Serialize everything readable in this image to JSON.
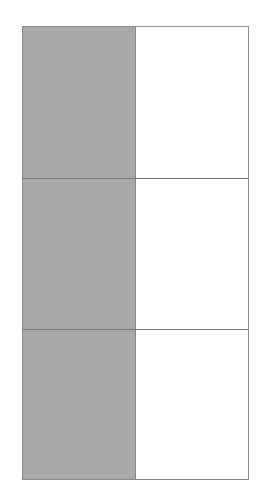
{
  "diagram": {
    "rows": 3,
    "columns": 2,
    "shaded_column": "left",
    "fraction_shaded": "1/2",
    "colors": {
      "shaded": "#a9a9a9",
      "unshaded": "#ffffff",
      "border": "#8a8a8a"
    },
    "cells": [
      {
        "row": 1,
        "left": "shaded",
        "right": "unshaded"
      },
      {
        "row": 2,
        "left": "shaded",
        "right": "unshaded"
      },
      {
        "row": 3,
        "left": "shaded",
        "right": "unshaded"
      }
    ]
  }
}
